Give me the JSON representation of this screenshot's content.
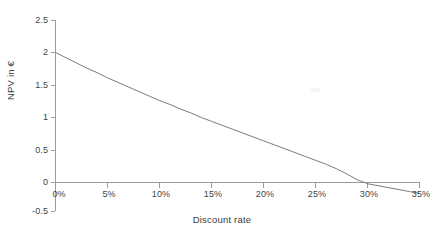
{
  "chart_data": {
    "type": "line",
    "title": "",
    "xlabel": "Discount rate",
    "ylabel": "NPV in €",
    "xlim": [
      0,
      35
    ],
    "ylim": [
      -0.5,
      2.5
    ],
    "grid": false,
    "legend": null,
    "x_tick_labels": [
      "0%",
      "5%",
      "10%",
      "15%",
      "20%",
      "25%",
      "30%",
      "35%"
    ],
    "x_ticks": [
      0,
      5,
      10,
      15,
      20,
      25,
      30,
      35
    ],
    "y_tick_labels": [
      "2.5",
      "2",
      "1.5",
      "1",
      "0.5",
      "0",
      "-0.5"
    ],
    "y_ticks": [
      2.5,
      2,
      1.5,
      1,
      0.5,
      0,
      -0.5
    ],
    "x_unit": "%",
    "series": [
      {
        "name": "NPV",
        "color": "#7c7c7c",
        "x": [
          0,
          1,
          2,
          3,
          4,
          5,
          6,
          7,
          8,
          9,
          10,
          11,
          12,
          13,
          14,
          15,
          16,
          17,
          18,
          19,
          20,
          21,
          22,
          23,
          24,
          25,
          26,
          27,
          28,
          29,
          30,
          31,
          32,
          33,
          34,
          35
        ],
        "y": [
          2.0,
          1.92,
          1.84,
          1.76,
          1.69,
          1.61,
          1.54,
          1.47,
          1.4,
          1.33,
          1.26,
          1.2,
          1.13,
          1.07,
          1.0,
          0.94,
          0.88,
          0.82,
          0.76,
          0.7,
          0.64,
          0.58,
          0.52,
          0.46,
          0.4,
          0.34,
          0.28,
          0.21,
          0.13,
          0.04,
          -0.02,
          -0.05,
          -0.08,
          -0.11,
          -0.14,
          -0.17
        ]
      }
    ],
    "annotations": [
      {
        "name": "zero-crossing",
        "x": 28.5,
        "y": 0,
        "label": ""
      }
    ]
  }
}
